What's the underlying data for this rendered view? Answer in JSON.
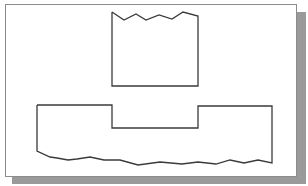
{
  "diagram": {
    "type": "technical-drawing",
    "colors": {
      "background": "#ffffff",
      "frame_border": "#8c8c8c",
      "shadow": "#9a9a9a",
      "stroke": "#3a3a3a"
    },
    "shapes": [
      {
        "name": "upper-part",
        "points": "112,12 124,20 136,14 146,20 159,15 172,19 183,12 198,16 198,86 112,86 112,12"
      },
      {
        "name": "lower-base-with-notch",
        "points": "37,105 112,105 112,128 198,128 198,106 272,106 272,163 258,160 244,163 230,160 216,164 198,162 182,164 160,162 138,165 120,160 104,160 90,157 77,159 68,160 57,158 50,157 37,151 37,105"
      }
    ]
  }
}
